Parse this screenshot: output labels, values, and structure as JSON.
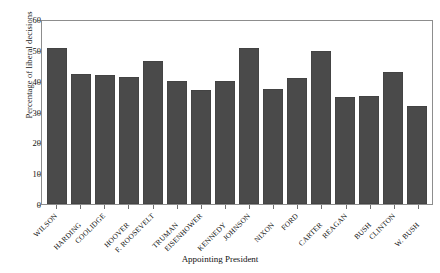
{
  "chart_data": {
    "type": "bar",
    "title": "",
    "xlabel": "Appointing President",
    "ylabel": "Percentage of liberal decisions",
    "ylim": [
      0,
      60
    ],
    "yticks": [
      0,
      10,
      20,
      30,
      40,
      50,
      60
    ],
    "grid": false,
    "legend": null,
    "bar_color": "#4a4a4a",
    "categories": [
      "WILSON",
      "HARDING",
      "COOLIDGE",
      "HOOVER",
      "F. ROOSEVELT",
      "TRUMAN",
      "EISENHOWER",
      "KENNEDY",
      "JOHNSON",
      "NIXON",
      "FORD",
      "CARTER",
      "REAGAN",
      "BUSH",
      "CLINTON",
      "W. BUSH"
    ],
    "values": [
      51.0,
      42.7,
      42.4,
      41.6,
      47.0,
      40.2,
      37.4,
      40.2,
      51.3,
      37.7,
      41.4,
      50.2,
      35.1,
      35.4,
      43.2,
      32.3
    ]
  }
}
